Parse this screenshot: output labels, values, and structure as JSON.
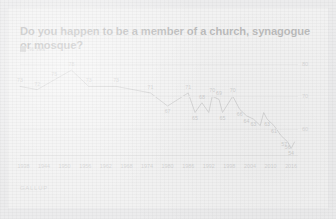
{
  "header": {
    "title": "Do you happen to be a member of a church, synagogue or mosque?"
  },
  "legend": {
    "swatch_color": "#8a8a8a",
    "label": "% Yes"
  },
  "footer": {
    "source": "GALLUP"
  },
  "axis": {
    "y_ticks": [
      "80",
      "70",
      "60"
    ],
    "x_ticks": [
      "1938",
      "1944",
      "1950",
      "1956",
      "1962",
      "1968",
      "1974",
      "1980",
      "1986",
      "1992",
      "1998",
      "2004",
      "2010",
      "2016"
    ]
  },
  "chart_data": {
    "type": "line",
    "title": "Do you happen to be a member of a church, synagogue or mosque?",
    "xlabel": "",
    "ylabel": "% Yes",
    "ylim": [
      52,
      82
    ],
    "xlim": [
      1937,
      2018
    ],
    "grid": true,
    "legend_position": "top-left",
    "line_color": "#7c7c7c",
    "series": [
      {
        "name": "% Yes",
        "points": [
          {
            "x": 1937,
            "y": 73,
            "label": "73"
          },
          {
            "x": 1942,
            "y": 72,
            "label": "72"
          },
          {
            "x": 1947,
            "y": 75,
            "label": "75"
          },
          {
            "x": 1952,
            "y": 78,
            "label": "78"
          },
          {
            "x": 1957,
            "y": 73,
            "label": "73"
          },
          {
            "x": 1965,
            "y": 73,
            "label": "73"
          },
          {
            "x": 1975,
            "y": 71,
            "label": "71"
          },
          {
            "x": 1980,
            "y": 67,
            "label": "67"
          },
          {
            "x": 1983,
            "y": 69,
            "label": null
          },
          {
            "x": 1986,
            "y": 71,
            "label": "71"
          },
          {
            "x": 1988,
            "y": 65,
            "label": "65"
          },
          {
            "x": 1990,
            "y": 68,
            "label": "68"
          },
          {
            "x": 1992,
            "y": 65,
            "label": null
          },
          {
            "x": 1993,
            "y": 70,
            "label": "70"
          },
          {
            "x": 1995,
            "y": 69,
            "label": "69"
          },
          {
            "x": 1996,
            "y": 65,
            "label": "65"
          },
          {
            "x": 1999,
            "y": 70,
            "label": "70"
          },
          {
            "x": 2001,
            "y": 66,
            "label": "66"
          },
          {
            "x": 2003,
            "y": 64,
            "label": "64"
          },
          {
            "x": 2005,
            "y": 63,
            "label": "63"
          },
          {
            "x": 2007,
            "y": 61,
            "label": null
          },
          {
            "x": 2008,
            "y": 65,
            "label": null
          },
          {
            "x": 2009,
            "y": 63,
            "label": "63"
          },
          {
            "x": 2011,
            "y": 61,
            "label": "61"
          },
          {
            "x": 2013,
            "y": 58,
            "label": null
          },
          {
            "x": 2014,
            "y": 57,
            "label": "57"
          },
          {
            "x": 2015,
            "y": 56,
            "label": "56"
          },
          {
            "x": 2016,
            "y": 54,
            "label": "54"
          },
          {
            "x": 2017,
            "y": 56,
            "label": null
          }
        ]
      }
    ]
  }
}
